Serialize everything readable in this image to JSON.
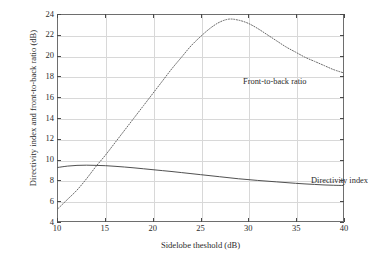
{
  "chart_data": {
    "type": "line",
    "title": "",
    "subtitle": "",
    "xlabel": "Sidelobe theshold (dB)",
    "ylabel": "Directivity index and front-to-back ratio (dB)",
    "xlim": [
      10,
      40
    ],
    "ylim": [
      4,
      24
    ],
    "xticks": [
      10,
      15,
      20,
      25,
      30,
      35,
      40
    ],
    "yticks": [
      4,
      6,
      8,
      10,
      12,
      14,
      16,
      18,
      20,
      22,
      24
    ],
    "xtick_labels": [
      "10",
      "15",
      "20",
      "25",
      "30",
      "35",
      "40"
    ],
    "ytick_labels": [
      "4",
      "6",
      "8",
      "10",
      "12",
      "14",
      "16",
      "18",
      "20",
      "22",
      "24"
    ],
    "grid": true,
    "grid_color": "#d8d8d8",
    "legend_position": "inline-annotations",
    "background_color": "#ffffff",
    "frame_color": "#6e6e6e",
    "series": [
      {
        "name": "Front-to-back ratio",
        "style": "dotted",
        "color": "#555555",
        "annotation": "Front-to-back ratio",
        "x": [
          10,
          11,
          12,
          13,
          14,
          15,
          16,
          17,
          18,
          19,
          20,
          21,
          22,
          23,
          24,
          25,
          26,
          27,
          28,
          29,
          30,
          31,
          32,
          33,
          34,
          35,
          36,
          37,
          38,
          39,
          40
        ],
        "values": [
          5.2,
          6.1,
          7.0,
          8.1,
          9.3,
          10.4,
          11.6,
          12.8,
          14.0,
          15.2,
          16.4,
          17.6,
          18.8,
          19.9,
          21.0,
          21.9,
          22.7,
          23.3,
          23.6,
          23.5,
          23.2,
          22.7,
          22.1,
          21.5,
          20.9,
          20.4,
          19.9,
          19.5,
          19.1,
          18.7,
          18.4
        ]
      },
      {
        "name": "Directivity index",
        "style": "solid",
        "color": "#3a3a3a",
        "annotation": "Directivity index",
        "x": [
          10,
          11,
          12,
          13,
          14,
          15,
          16,
          17,
          18,
          19,
          20,
          21,
          22,
          23,
          24,
          25,
          26,
          27,
          28,
          29,
          30,
          31,
          32,
          33,
          34,
          35,
          36,
          37,
          38,
          39,
          40
        ],
        "values": [
          9.2,
          9.33,
          9.4,
          9.42,
          9.4,
          9.37,
          9.31,
          9.24,
          9.16,
          9.07,
          8.98,
          8.89,
          8.8,
          8.7,
          8.6,
          8.5,
          8.4,
          8.3,
          8.2,
          8.1,
          8.02,
          7.94,
          7.87,
          7.8,
          7.73,
          7.66,
          7.6,
          7.55,
          7.5,
          7.47,
          7.45
        ]
      }
    ]
  },
  "axes": {
    "x_title": "Sidelobe theshold (dB)",
    "y_title": "Directivity index and front-to-back ratio (dB)"
  },
  "annotations": {
    "front_to_back": "Front-to-back ratio",
    "directivity": "Directivity index"
  }
}
